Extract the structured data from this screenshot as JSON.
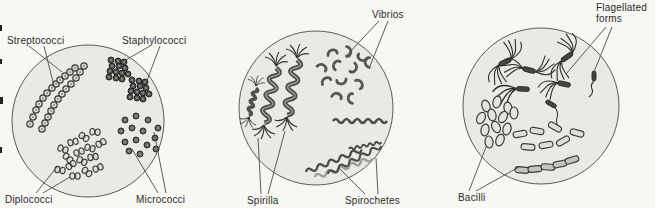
{
  "figure": {
    "panel_cocci": {
      "streptococci": "Streptococci",
      "staphylococci": "Staphylococci",
      "diplococci": "Diplococci",
      "micrococci": "Micrococci"
    },
    "panel_spiral": {
      "vibrios": "Vibrios",
      "spirilla": "Spirilla",
      "spirochetes": "Spirochetes"
    },
    "panel_rods": {
      "flagellated_line1": "Flagellated",
      "flagellated_line2": "forms",
      "bacilli": "Bacilli"
    }
  },
  "colors": {
    "background": "#f7f7f4",
    "field_fill": "#e9e9e6",
    "field_outline": "#5a5a58",
    "ink": "#2b2b2b",
    "dark_organism": "#4a4a48",
    "light_organism": "#dedddb"
  }
}
